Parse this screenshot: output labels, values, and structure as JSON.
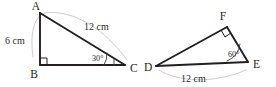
{
  "figure": {
    "background_color": "#ffffff",
    "stroke_color": "#231f20",
    "guide_color": "#c9c6c4",
    "width": 276,
    "height": 87
  },
  "triangles": [
    {
      "id": "triangle-abc",
      "name": "Triangle ABC",
      "vertices": [
        {
          "key": "A",
          "label": "A",
          "x": 40,
          "y": 13,
          "label_x": 36,
          "label_y": 10
        },
        {
          "key": "B",
          "label": "B",
          "x": 40,
          "y": 65,
          "label_x": 34,
          "label_y": 78
        },
        {
          "key": "C",
          "label": "C",
          "x": 125,
          "y": 65,
          "label_x": 130,
          "label_y": 72
        }
      ],
      "sides": [
        {
          "key": "AB",
          "from": "A",
          "to": "B",
          "measure": "6 cm",
          "label_x": 5,
          "label_y": 44
        },
        {
          "key": "BC",
          "from": "B",
          "to": "C",
          "measure": "",
          "label_x": 0,
          "label_y": 0
        },
        {
          "key": "AC",
          "from": "A",
          "to": "C",
          "measure": "12 cm",
          "label_x": 84,
          "label_y": 30
        }
      ],
      "angles": [
        {
          "key": "B",
          "label": "",
          "type": "right",
          "at_x": 40,
          "at_y": 65
        },
        {
          "key": "C",
          "label": "30°",
          "type": "marked",
          "at_x": 125,
          "at_y": 65,
          "label_x": 92,
          "label_y": 61
        }
      ]
    },
    {
      "id": "triangle-def",
      "name": "Triangle DEF",
      "vertices": [
        {
          "key": "D",
          "label": "D",
          "x": 156,
          "y": 66,
          "label_x": 144,
          "label_y": 71
        },
        {
          "key": "E",
          "label": "E",
          "x": 248,
          "y": 62,
          "label_x": 253,
          "label_y": 68
        },
        {
          "key": "F",
          "label": "F",
          "x": 227,
          "y": 27,
          "label_x": 223,
          "label_y": 20
        }
      ],
      "sides": [
        {
          "key": "DF",
          "from": "D",
          "to": "F",
          "measure": "",
          "label_x": 0,
          "label_y": 0
        },
        {
          "key": "FE",
          "from": "F",
          "to": "E",
          "measure": "",
          "label_x": 0,
          "label_y": 0
        },
        {
          "key": "DE",
          "from": "D",
          "to": "E",
          "measure": "12 cm",
          "label_x": 181,
          "label_y": 81
        }
      ],
      "angles": [
        {
          "key": "F",
          "label": "",
          "type": "right",
          "at_x": 227,
          "at_y": 27
        },
        {
          "key": "E",
          "label": "60°",
          "type": "marked",
          "at_x": 248,
          "at_y": 62,
          "label_x": 228,
          "label_y": 57
        }
      ]
    }
  ],
  "labels": {
    "left_side_measure": "6 cm",
    "left_hypotenuse_measure": "12 cm",
    "left_angle_c": "30°",
    "right_base_measure": "12 cm",
    "right_angle_e": "60°",
    "vertex_a": "A",
    "vertex_b": "B",
    "vertex_c": "C",
    "vertex_d": "D",
    "vertex_e": "E",
    "vertex_f": "F"
  }
}
